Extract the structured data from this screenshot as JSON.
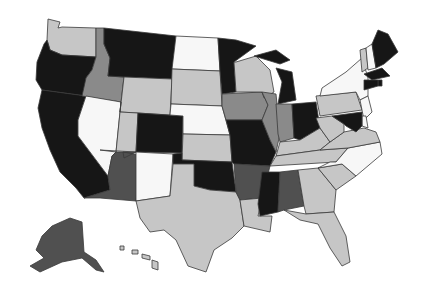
{
  "map": {
    "title": "",
    "type": "choropleth",
    "region": "United States",
    "palette": {
      "white": "#f7f7f7",
      "light": "#c6c6c6",
      "medium": "#8a8a8a",
      "dark": "#505050",
      "black": "#161616"
    },
    "states": [
      {
        "id": "WA",
        "name": "Washington",
        "category": "light"
      },
      {
        "id": "OR",
        "name": "Oregon",
        "category": "black"
      },
      {
        "id": "CA",
        "name": "California",
        "category": "black"
      },
      {
        "id": "ID",
        "name": "Idaho",
        "category": "medium"
      },
      {
        "id": "NV",
        "name": "Nevada",
        "category": "white"
      },
      {
        "id": "MT",
        "name": "Montana",
        "category": "black"
      },
      {
        "id": "WY",
        "name": "Wyoming",
        "category": "light"
      },
      {
        "id": "UT",
        "name": "Utah",
        "category": "light"
      },
      {
        "id": "AZ",
        "name": "Arizona",
        "category": "dark"
      },
      {
        "id": "CO",
        "name": "Colorado",
        "category": "black"
      },
      {
        "id": "NM",
        "name": "New Mexico",
        "category": "white"
      },
      {
        "id": "ND",
        "name": "North Dakota",
        "category": "white"
      },
      {
        "id": "SD",
        "name": "South Dakota",
        "category": "light"
      },
      {
        "id": "NE",
        "name": "Nebraska",
        "category": "white"
      },
      {
        "id": "KS",
        "name": "Kansas",
        "category": "light"
      },
      {
        "id": "OK",
        "name": "Oklahoma",
        "category": "black"
      },
      {
        "id": "TX",
        "name": "Texas",
        "category": "light"
      },
      {
        "id": "MN",
        "name": "Minnesota",
        "category": "black"
      },
      {
        "id": "IA",
        "name": "Iowa",
        "category": "medium"
      },
      {
        "id": "MO",
        "name": "Missouri",
        "category": "black"
      },
      {
        "id": "AR",
        "name": "Arkansas",
        "category": "dark"
      },
      {
        "id": "LA",
        "name": "Louisiana",
        "category": "light"
      },
      {
        "id": "WI",
        "name": "Wisconsin",
        "category": "light"
      },
      {
        "id": "IL",
        "name": "Illinois",
        "category": "medium"
      },
      {
        "id": "MI",
        "name": "Michigan",
        "category": "black"
      },
      {
        "id": "IN",
        "name": "Indiana",
        "category": "medium"
      },
      {
        "id": "OH",
        "name": "Ohio",
        "category": "black"
      },
      {
        "id": "KY",
        "name": "Kentucky",
        "category": "light"
      },
      {
        "id": "TN",
        "name": "Tennessee",
        "category": "light"
      },
      {
        "id": "MS",
        "name": "Mississippi",
        "category": "black"
      },
      {
        "id": "AL",
        "name": "Alabama",
        "category": "dark"
      },
      {
        "id": "GA",
        "name": "Georgia",
        "category": "light"
      },
      {
        "id": "FL",
        "name": "Florida",
        "category": "light"
      },
      {
        "id": "SC",
        "name": "South Carolina",
        "category": "light"
      },
      {
        "id": "NC",
        "name": "North Carolina",
        "category": "white"
      },
      {
        "id": "VA",
        "name": "Virginia",
        "category": "light"
      },
      {
        "id": "WV",
        "name": "West Virginia",
        "category": "light"
      },
      {
        "id": "PA",
        "name": "Pennsylvania",
        "category": "light"
      },
      {
        "id": "NY",
        "name": "New York",
        "category": "white"
      },
      {
        "id": "VT",
        "name": "Vermont",
        "category": "light"
      },
      {
        "id": "NH",
        "name": "New Hampshire",
        "category": "white"
      },
      {
        "id": "ME",
        "name": "Maine",
        "category": "black"
      },
      {
        "id": "MA",
        "name": "Massachusetts",
        "category": "black"
      },
      {
        "id": "RI",
        "name": "Rhode Island",
        "category": "black"
      },
      {
        "id": "CT",
        "name": "Connecticut",
        "category": "black"
      },
      {
        "id": "NJ",
        "name": "New Jersey",
        "category": "white"
      },
      {
        "id": "DE",
        "name": "Delaware",
        "category": "white"
      },
      {
        "id": "MD",
        "name": "Maryland",
        "category": "black"
      },
      {
        "id": "AK",
        "name": "Alaska",
        "category": "dark"
      },
      {
        "id": "HI",
        "name": "Hawaii",
        "category": "light"
      }
    ]
  }
}
